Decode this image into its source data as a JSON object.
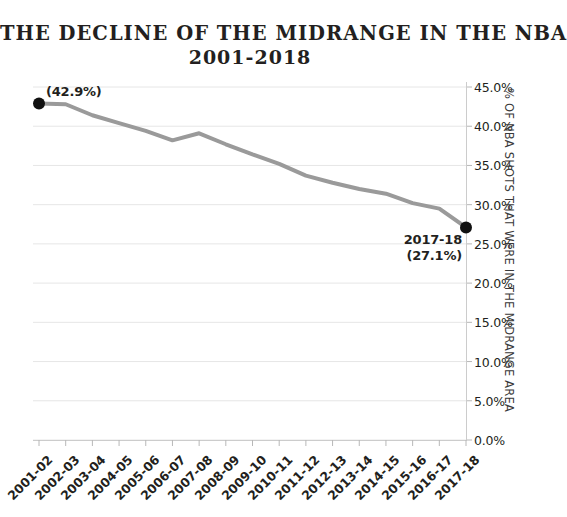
{
  "title": {
    "line1": "THE DECLINE OF THE MIDRANGE IN THE NBA",
    "line2": "2001-2018"
  },
  "axes": {
    "y_title": "% OF NBA SHOTS THAT WERE IN THE MIDRANGE AREA",
    "y_ticks": [
      "45.0%",
      "40.0%",
      "35.0%",
      "30.0%",
      "25.0%",
      "20.0%",
      "15.0%",
      "10.0%",
      "5.0%",
      "0.0%"
    ],
    "x_ticks": [
      "2001-02",
      "2002-03",
      "2003-04",
      "2004-05",
      "2005-06",
      "2006-07",
      "2007-08",
      "2008-09",
      "2009-10",
      "2010-11",
      "2011-12",
      "2012-13",
      "2013-14",
      "2014-15",
      "2015-16",
      "2016-17",
      "2017-18"
    ]
  },
  "annotations": {
    "start_value": "(42.9%)",
    "end_season": "2017-18",
    "end_value": "(27.1%)"
  },
  "colors": {
    "line": "#9a9a9a",
    "marker": "#111111",
    "gridline": "#e6e6e6",
    "axis": "#cccccc",
    "text": "#231f20"
  },
  "chart_data": {
    "type": "line",
    "title": "THE DECLINE OF THE MIDRANGE IN THE NBA 2001-2018",
    "xlabel": "",
    "ylabel": "% OF NBA SHOTS THAT WERE IN THE MIDRANGE AREA",
    "ylim": [
      0,
      45
    ],
    "ytick_values": [
      45,
      40,
      35,
      30,
      25,
      20,
      15,
      10,
      5,
      0
    ],
    "grid": true,
    "legend": "none",
    "categories": [
      "2001-02",
      "2002-03",
      "2003-04",
      "2004-05",
      "2005-06",
      "2006-07",
      "2007-08",
      "2008-09",
      "2009-10",
      "2010-11",
      "2011-12",
      "2012-13",
      "2013-14",
      "2014-15",
      "2015-16",
      "2016-17",
      "2017-18"
    ],
    "values": [
      42.9,
      42.8,
      41.4,
      40.4,
      39.4,
      38.2,
      39.1,
      37.7,
      36.4,
      35.2,
      33.7,
      32.8,
      32.0,
      31.4,
      30.2,
      29.5,
      27.1
    ],
    "annotated_points": [
      {
        "category": "2001-02",
        "value": 42.9,
        "label": "(42.9%)"
      },
      {
        "category": "2017-18",
        "value": 27.1,
        "label": "2017-18 (27.1%)"
      }
    ]
  }
}
